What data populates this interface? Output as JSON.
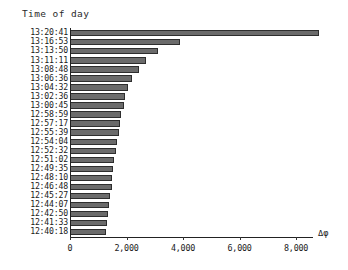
{
  "chart_data": {
    "type": "bar",
    "orientation": "horizontal",
    "title": "",
    "ylabel": "Time of day",
    "xlabel": "Δφ",
    "grid": false,
    "legend": null,
    "xlim": [
      0,
      9200
    ],
    "xticks": [
      0,
      2000,
      4000,
      6000,
      8000
    ],
    "xtick_labels": [
      "0",
      "2,000",
      "4,000",
      "6,000",
      "8,000"
    ],
    "categories": [
      "13:20:41",
      "13:16:53",
      "13:13:50",
      "13:11:11",
      "13:08:48",
      "13:06:36",
      "13:04:32",
      "13:02:36",
      "13:00:45",
      "12:58:59",
      "12:57:17",
      "12:55:39",
      "12:54:04",
      "12:52:32",
      "12:51:02",
      "12:49:35",
      "12:48:10",
      "12:46:48",
      "12:45:27",
      "12:44:07",
      "12:42:50",
      "12:41:33",
      "12:40:18"
    ],
    "values": [
      8800,
      3900,
      3100,
      2700,
      2450,
      2200,
      2050,
      1950,
      1900,
      1820,
      1780,
      1720,
      1680,
      1620,
      1560,
      1530,
      1500,
      1470,
      1420,
      1380,
      1350,
      1320,
      1260
    ],
    "bar_color": "#6b6b6b",
    "bar_edge_color": "#2e2e2e",
    "axis_color": "#222222"
  }
}
